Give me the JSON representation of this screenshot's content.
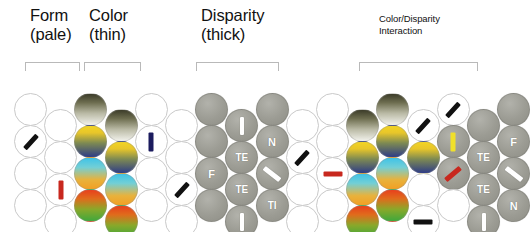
{
  "figure": {
    "background_color": "#ffffff",
    "groups": [
      {
        "id": "form",
        "label": "Form\n(pale)",
        "size": "big",
        "x": 30,
        "y": 6,
        "bracket": {
          "x": 25,
          "y": 62,
          "w": 55
        }
      },
      {
        "id": "color",
        "label": "Color\n(thin)",
        "size": "big",
        "x": 89,
        "y": 6,
        "bracket": {
          "x": 84,
          "y": 62,
          "w": 57
        }
      },
      {
        "id": "disparity",
        "label": "Disparity\n(thick)",
        "size": "big",
        "x": 201,
        "y": 6,
        "bracket": {
          "x": 196,
          "y": 62,
          "w": 83
        }
      },
      {
        "id": "interaction",
        "label": "Color/Disparity\nInteraction",
        "size": "small",
        "x": 379,
        "y": 13,
        "bracket": {
          "x": 359,
          "y": 62,
          "w": 119
        }
      }
    ],
    "legend": {
      "empty_circle": "pale / unfilled unit",
      "gray_circle": "disparity-selective unit",
      "color_gradient_circle": "color-selective unit",
      "bar_marker": "preferred orientation bar"
    },
    "markers": {
      "black": "#111111",
      "navy": "#1b1b5e",
      "red": "#c8281e",
      "yellow": "#f0e02a",
      "white": "#ffffff"
    },
    "disc_labels": [
      "I",
      "N",
      "F",
      "TE",
      "TI",
      "/"
    ],
    "cells": [
      {
        "col": 0,
        "row": 0,
        "type": "empty"
      },
      {
        "col": 0,
        "row": 1,
        "type": "empty",
        "bar": {
          "angle": -48,
          "color": "black",
          "w": 18,
          "h": 5
        }
      },
      {
        "col": 0,
        "row": 2,
        "type": "empty"
      },
      {
        "col": 0,
        "row": 3,
        "type": "empty"
      },
      {
        "col": 1,
        "row": 0,
        "type": "empty"
      },
      {
        "col": 1,
        "row": 1,
        "type": "empty"
      },
      {
        "col": 1,
        "row": 2,
        "type": "empty",
        "bar": {
          "angle": 0,
          "color": "red",
          "w": 5,
          "h": 19
        }
      },
      {
        "col": 1,
        "row": 3,
        "type": "empty"
      },
      {
        "col": 2,
        "row": 0,
        "type": "tint",
        "tint": "dark"
      },
      {
        "col": 2,
        "row": 1,
        "type": "tint",
        "tint": "yellowblue"
      },
      {
        "col": 2,
        "row": 2,
        "type": "tint",
        "tint": "cyanorange"
      },
      {
        "col": 2,
        "row": 3,
        "type": "tint",
        "tint": "redgreen"
      },
      {
        "col": 3,
        "row": 0,
        "type": "tint",
        "tint": "dark"
      },
      {
        "col": 3,
        "row": 1,
        "type": "tint",
        "tint": "yellowblue"
      },
      {
        "col": 3,
        "row": 2,
        "type": "tint",
        "tint": "cyanorange"
      },
      {
        "col": 3,
        "row": 3,
        "type": "tint",
        "tint": "redgreen"
      },
      {
        "col": 4,
        "row": 0,
        "type": "empty"
      },
      {
        "col": 4,
        "row": 1,
        "type": "empty",
        "bar": {
          "angle": 0,
          "color": "navy",
          "w": 5,
          "h": 19
        }
      },
      {
        "col": 4,
        "row": 2,
        "type": "empty"
      },
      {
        "col": 4,
        "row": 3,
        "type": "empty"
      },
      {
        "col": 5,
        "row": 0,
        "type": "empty"
      },
      {
        "col": 5,
        "row": 1,
        "type": "empty"
      },
      {
        "col": 5,
        "row": 2,
        "type": "empty",
        "bar": {
          "angle": -48,
          "color": "black",
          "w": 18,
          "h": 5
        }
      },
      {
        "col": 5,
        "row": 3,
        "type": "empty"
      },
      {
        "col": 6,
        "row": 0,
        "type": "gray"
      },
      {
        "col": 6,
        "row": 1,
        "type": "gray"
      },
      {
        "col": 6,
        "row": 2,
        "type": "gray",
        "text": "F"
      },
      {
        "col": 6,
        "row": 3,
        "type": "gray"
      },
      {
        "col": 7,
        "row": 0,
        "type": "gray",
        "bar": {
          "angle": 0,
          "color": "white",
          "w": 4,
          "h": 18
        }
      },
      {
        "col": 7,
        "row": 1,
        "type": "gray",
        "text": "TE"
      },
      {
        "col": 7,
        "row": 2,
        "type": "gray",
        "text": "TE"
      },
      {
        "col": 7,
        "row": 3,
        "type": "gray",
        "bar": {
          "angle": 0,
          "color": "white",
          "w": 4,
          "h": 18
        }
      },
      {
        "col": 8,
        "row": 0,
        "type": "gray"
      },
      {
        "col": 8,
        "row": 1,
        "type": "gray",
        "text": "N"
      },
      {
        "col": 8,
        "row": 2,
        "type": "gray",
        "bar": {
          "angle": 38,
          "color": "white",
          "w": 20,
          "h": 5
        }
      },
      {
        "col": 8,
        "row": 3,
        "type": "gray",
        "text": "TI"
      },
      {
        "col": 9,
        "row": 0,
        "type": "empty"
      },
      {
        "col": 9,
        "row": 1,
        "type": "empty",
        "bar": {
          "angle": -48,
          "color": "black",
          "w": 18,
          "h": 5
        }
      },
      {
        "col": 9,
        "row": 2,
        "type": "empty"
      },
      {
        "col": 9,
        "row": 3,
        "type": "empty"
      },
      {
        "col": 10,
        "row": 0,
        "type": "empty"
      },
      {
        "col": 10,
        "row": 1,
        "type": "empty"
      },
      {
        "col": 10,
        "row": 2,
        "type": "empty",
        "bar": {
          "angle": 0,
          "color": "red",
          "w": 19,
          "h": 5
        }
      },
      {
        "col": 10,
        "row": 3,
        "type": "empty"
      },
      {
        "col": 11,
        "row": 0,
        "type": "tint",
        "tint": "dark"
      },
      {
        "col": 11,
        "row": 1,
        "type": "tint",
        "tint": "yellowblue"
      },
      {
        "col": 11,
        "row": 2,
        "type": "tint",
        "tint": "cyanorange"
      },
      {
        "col": 11,
        "row": 3,
        "type": "tint",
        "tint": "redgreen"
      },
      {
        "col": 12,
        "row": 0,
        "type": "tint",
        "tint": "dark"
      },
      {
        "col": 12,
        "row": 1,
        "type": "tint",
        "tint": "yellowblue"
      },
      {
        "col": 12,
        "row": 2,
        "type": "tint",
        "tint": "cyanorange"
      },
      {
        "col": 12,
        "row": 3,
        "type": "tint",
        "tint": "redgreen"
      },
      {
        "col": 13,
        "row": 0,
        "type": "empty",
        "bar": {
          "angle": -48,
          "color": "black",
          "w": 18,
          "h": 5
        }
      },
      {
        "col": 13,
        "row": 1,
        "type": "tint",
        "tint": "yellowblue"
      },
      {
        "col": 13,
        "row": 2,
        "type": "empty"
      },
      {
        "col": 13,
        "row": 3,
        "type": "empty",
        "bar": {
          "angle": 0,
          "color": "black",
          "w": 19,
          "h": 5
        }
      },
      {
        "col": 14,
        "row": 0,
        "type": "empty",
        "bar": {
          "angle": -48,
          "color": "black",
          "w": 18,
          "h": 5
        }
      },
      {
        "col": 14,
        "row": 1,
        "type": "gray",
        "bar": {
          "angle": 0,
          "color": "yellow",
          "w": 5,
          "h": 19
        }
      },
      {
        "col": 14,
        "row": 2,
        "type": "gray",
        "bar": {
          "angle": -40,
          "color": "red",
          "w": 19,
          "h": 5
        }
      },
      {
        "col": 14,
        "row": 3,
        "type": "empty"
      },
      {
        "col": 15,
        "row": 0,
        "type": "gray"
      },
      {
        "col": 15,
        "row": 1,
        "type": "gray",
        "text": "TE"
      },
      {
        "col": 15,
        "row": 2,
        "type": "gray",
        "text": "TE"
      },
      {
        "col": 15,
        "row": 3,
        "type": "gray",
        "bar": {
          "angle": 0,
          "color": "white",
          "w": 4,
          "h": 18
        }
      },
      {
        "col": 16,
        "row": 0,
        "type": "gray"
      },
      {
        "col": 16,
        "row": 1,
        "type": "gray",
        "text": "F"
      },
      {
        "col": 16,
        "row": 2,
        "type": "gray",
        "bar": {
          "angle": 38,
          "color": "white",
          "w": 20,
          "h": 5
        }
      },
      {
        "col": 16,
        "row": 3,
        "type": "gray",
        "text": "N"
      }
    ],
    "grid": {
      "x0": 14,
      "col_step": 30.2,
      "y0": 93,
      "row_step": 32,
      "odd_col_offset": 16,
      "diameter": 33
    }
  }
}
